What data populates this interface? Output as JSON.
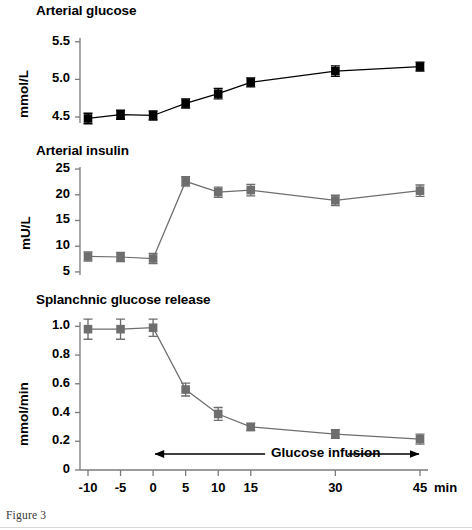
{
  "figure": {
    "caption": "Figure 3",
    "x_unit_label": "min",
    "annotation": "Glucose infusion",
    "marker_color_black": "#000000",
    "marker_color_gray": "#6e6e6e"
  },
  "x_axis": {
    "label": "min",
    "ticks": [
      -10,
      -5,
      0,
      5,
      10,
      15,
      30,
      45
    ],
    "tick_labels": [
      "-10",
      "-5",
      "0",
      "5",
      "10",
      "15",
      "30",
      "45"
    ],
    "min": -10,
    "max": 45
  },
  "chart_data": [
    {
      "type": "line",
      "title": "Arterial glucose",
      "ylabel": "mmol/L",
      "xlabel": "min",
      "color": "#000000",
      "x": [
        -10,
        -5,
        0,
        5,
        10,
        15,
        30,
        45
      ],
      "xtick_labels": [
        "-10",
        "-5",
        "0",
        "5",
        "10",
        "15",
        "30",
        "45"
      ],
      "values": [
        4.48,
        4.53,
        4.52,
        4.68,
        4.81,
        4.96,
        5.11,
        5.17
      ],
      "errors": [
        0.07,
        0.06,
        0.06,
        0.06,
        0.07,
        0.06,
        0.07,
        0.06
      ],
      "yticks": [
        4.5,
        5.0,
        5.5
      ],
      "ytick_labels": [
        "4.5",
        "5.0",
        "5.5"
      ],
      "ylim": [
        4.42,
        5.55
      ],
      "grid": false,
      "legend": "none"
    },
    {
      "type": "line",
      "title": "Arterial insulin",
      "ylabel": "mU/L",
      "xlabel": "min",
      "color": "#6e6e6e",
      "x": [
        -10,
        -5,
        0,
        5,
        10,
        15,
        30,
        45
      ],
      "xtick_labels": [
        "-10",
        "-5",
        "0",
        "5",
        "10",
        "15",
        "30",
        "45"
      ],
      "values": [
        8.0,
        7.9,
        7.6,
        22.6,
        20.5,
        20.9,
        18.9,
        20.8
      ],
      "errors": [
        0.9,
        0.9,
        1.0,
        0.9,
        1.0,
        1.1,
        1.0,
        1.1
      ],
      "yticks": [
        5,
        10,
        15,
        20,
        25
      ],
      "ytick_labels": [
        "5",
        "10",
        "15",
        "20",
        "25"
      ],
      "ylim": [
        4.4,
        25.4
      ],
      "grid": false,
      "legend": "none"
    },
    {
      "type": "line",
      "title": "Splanchnic glucose release",
      "ylabel": "mmol/min",
      "xlabel": "min",
      "color": "#6e6e6e",
      "x": [
        -10,
        -5,
        0,
        5,
        10,
        15,
        30,
        45
      ],
      "xtick_labels": [
        "-10",
        "-5",
        "0",
        "5",
        "10",
        "15",
        "30",
        "45"
      ],
      "values": [
        0.98,
        0.98,
        0.99,
        0.56,
        0.39,
        0.3,
        0.25,
        0.215
      ],
      "errors": [
        0.07,
        0.07,
        0.06,
        0.045,
        0.045,
        0.025,
        0.03,
        0.035
      ],
      "yticks": [
        0,
        0.2,
        0.4,
        0.6,
        0.8,
        1.0
      ],
      "ytick_labels": [
        "0",
        "0.2",
        "0.4",
        "0.6",
        "0.8",
        "1.0"
      ],
      "ylim": [
        0,
        1.03
      ],
      "grid": false,
      "legend": "none",
      "annotation": {
        "text": "Glucose infusion",
        "from_x": 0,
        "to_x": 45
      }
    }
  ]
}
